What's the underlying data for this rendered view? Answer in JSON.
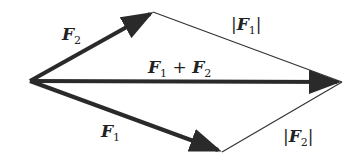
{
  "diagram": {
    "labels": {
      "f2": {
        "name": "F",
        "sub": "2"
      },
      "f1": {
        "name": "F",
        "sub": "1"
      },
      "sum": {
        "a": "F",
        "a_sub": "1",
        "op": " + ",
        "b": "F",
        "b_sub": "2"
      },
      "abs_f1": {
        "open": "|",
        "name": "F",
        "sub": "1",
        "close": "|"
      },
      "abs_f2": {
        "open": "|",
        "name": "F",
        "sub": "2",
        "close": "|"
      }
    },
    "colors": {
      "vector": "#2a2a2a",
      "thin": "#333333",
      "text": "#222222"
    }
  }
}
